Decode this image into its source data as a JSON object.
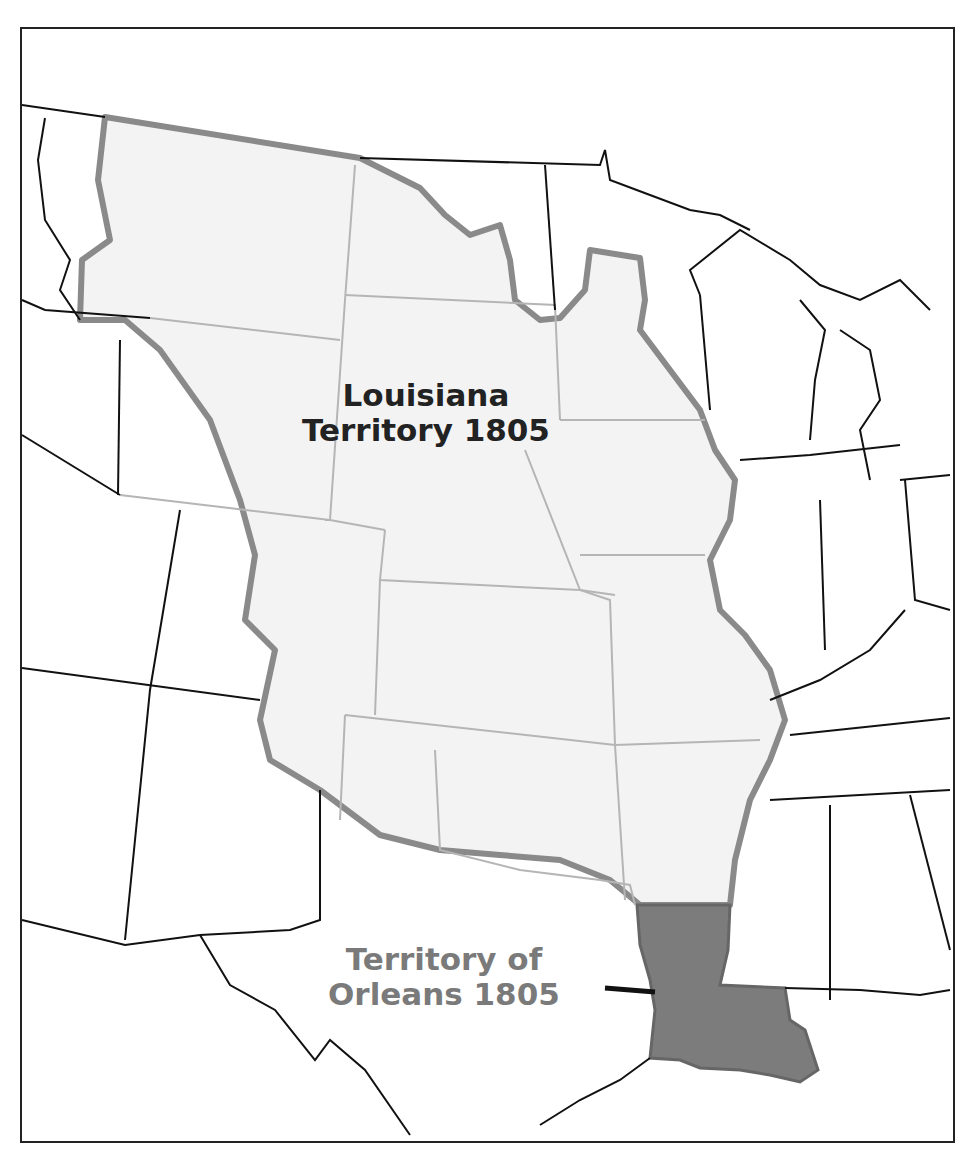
{
  "map": {
    "labels": {
      "louisiana_line1": "Louisiana",
      "louisiana_line2": "Territory 1805",
      "orleans_line1": "Territory of",
      "orleans_line2": "Orleans 1805"
    },
    "colors": {
      "louisiana_fill": "#f3f3f3",
      "louisiana_border": "#8a8a8a",
      "orleans_fill": "#7c7c7c",
      "state_lines": "#111111",
      "interior_state_lines": "#b5b5b5",
      "louisiana_label": "#222222",
      "orleans_label": "#7a7a7a"
    }
  }
}
